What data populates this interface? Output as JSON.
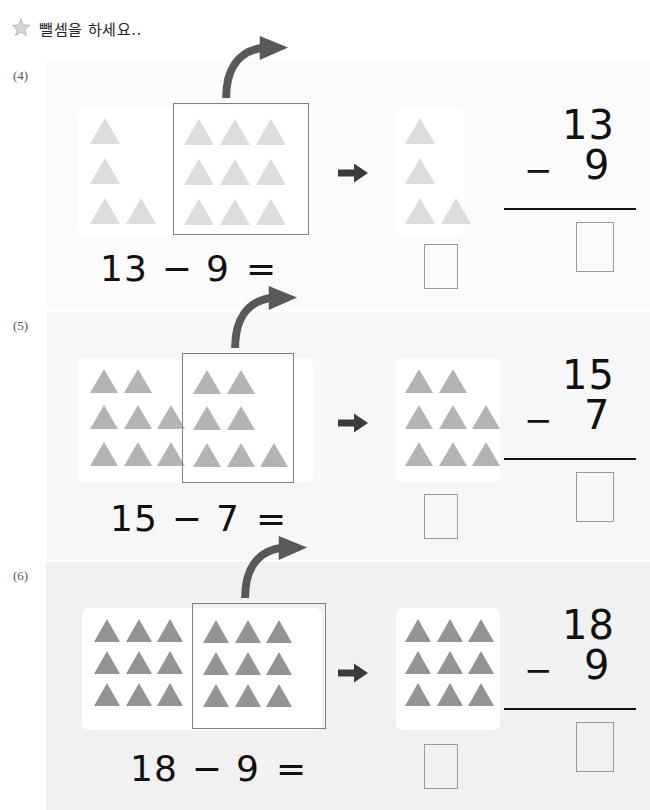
{
  "header": {
    "icon": "star-icon",
    "title": "뺄셈을 하세요.."
  },
  "colors": {
    "triangle_light": "#dcdcdc",
    "triangle_medium": "#b4b4b4",
    "triangle_dark": "#949494",
    "panel_bg": "#ffffff",
    "group_box_border": "#808080",
    "answer_box_border": "#9a9a9a",
    "arrow": "#595959",
    "text": "#111111",
    "label": "#555555",
    "row_bg_4": "#fbfbfb",
    "row_bg_5": "#f7f7f7",
    "row_bg_6": "#f1f1f1"
  },
  "problems": [
    {
      "label": "(4)",
      "minuend": "13",
      "subtrahend": "9",
      "operator": "−",
      "equals": "=",
      "equation_text": "13 − 9 =",
      "answer": "",
      "vertical": {
        "top": "13",
        "minus": "−",
        "bottom": "9",
        "answer": ""
      },
      "source_panel": {
        "total_triangles": 13,
        "outside_rows": [
          1,
          1,
          2
        ],
        "inside_rows": [
          3,
          3,
          3
        ],
        "inside_count": 9
      },
      "result_panel": {
        "total_triangles": 4,
        "rows": [
          1,
          1,
          2
        ]
      },
      "mid_arrow": "arrow-right-icon",
      "curve_arrow": "curved-arrow-icon",
      "triangle_color": "#dcdcdc",
      "bg": "#fbfbfb"
    },
    {
      "label": "(5)",
      "minuend": "15",
      "subtrahend": "7",
      "operator": "−",
      "equals": "=",
      "equation_text": "15 − 7 =",
      "answer": "",
      "vertical": {
        "top": "15",
        "minus": "−",
        "bottom": "7",
        "answer": ""
      },
      "source_panel": {
        "total_triangles": 15,
        "outside_rows": [
          2,
          3,
          3
        ],
        "inside_rows": [
          2,
          2,
          3
        ],
        "inside_count": 7
      },
      "result_panel": {
        "total_triangles": 8,
        "rows": [
          2,
          3,
          3
        ]
      },
      "mid_arrow": "arrow-right-icon",
      "curve_arrow": "curved-arrow-icon",
      "triangle_color": "#b4b4b4",
      "bg": "#f7f7f7"
    },
    {
      "label": "(6)",
      "minuend": "18",
      "subtrahend": "9",
      "operator": "−",
      "equals": "=",
      "equation_text": "18 − 9 =",
      "answer": "",
      "vertical": {
        "top": "18",
        "minus": "−",
        "bottom": "9",
        "answer": ""
      },
      "source_panel": {
        "total_triangles": 18,
        "outside_rows": [
          3,
          3,
          3
        ],
        "inside_rows": [
          3,
          3,
          3
        ],
        "inside_count": 9
      },
      "result_panel": {
        "total_triangles": 9,
        "rows": [
          3,
          3,
          3
        ]
      },
      "mid_arrow": "arrow-right-icon",
      "curve_arrow": "curved-arrow-icon",
      "triangle_color": "#949494",
      "bg": "#f1f1f1"
    }
  ]
}
